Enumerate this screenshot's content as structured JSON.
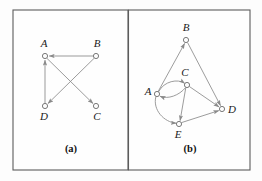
{
  "figure": {
    "background_color": "#fdfdfd",
    "frame_color": "#5c5c5c",
    "edge_color": "#8a8a8a",
    "node_fill": "#fdfdfd",
    "node_stroke": "#6b6b6b",
    "label_color": "#1a1a1a"
  },
  "panels": [
    {
      "id": "panel-a",
      "caption": "(a)",
      "caption_pos": {
        "x": 71,
        "y": 152
      },
      "frame": {
        "x": 13,
        "y": 10,
        "w": 115,
        "h": 160
      },
      "nodes": [
        {
          "id": "A",
          "label": "A",
          "cx": 45,
          "cy": 56,
          "r": 2.6,
          "label_x": 44,
          "label_y": 47
        },
        {
          "id": "B",
          "label": "B",
          "cx": 96,
          "cy": 56,
          "r": 2.6,
          "label_x": 97,
          "label_y": 47
        },
        {
          "id": "D",
          "label": "D",
          "cx": 45,
          "cy": 106,
          "r": 2.6,
          "label_x": 44,
          "label_y": 120
        },
        {
          "id": "C",
          "label": "C",
          "cx": 96,
          "cy": 106,
          "r": 2.6,
          "label_x": 97,
          "label_y": 120
        }
      ],
      "edges": [
        {
          "from": "B",
          "to": "A",
          "type": "straight",
          "directed": true
        },
        {
          "from": "D",
          "to": "A",
          "type": "straight",
          "directed": true
        },
        {
          "from": "B",
          "to": "D",
          "type": "straight",
          "directed": true
        },
        {
          "from": "A",
          "to": "C",
          "type": "straight",
          "directed": true
        }
      ]
    },
    {
      "id": "panel-b",
      "caption": "(b)",
      "caption_pos": {
        "x": 190,
        "y": 152
      },
      "frame": {
        "x": 129,
        "y": 10,
        "w": 121,
        "h": 160
      },
      "nodes": [
        {
          "id": "B",
          "label": "B",
          "cx": 186,
          "cy": 40,
          "r": 2.6,
          "label_x": 186,
          "label_y": 31
        },
        {
          "id": "C",
          "label": "C",
          "cx": 187,
          "cy": 85,
          "r": 2.6,
          "label_x": 185,
          "label_y": 76
        },
        {
          "id": "A",
          "label": "A",
          "cx": 157,
          "cy": 94,
          "r": 2.6,
          "label_x": 148,
          "label_y": 95
        },
        {
          "id": "D",
          "label": "D",
          "cx": 222,
          "cy": 109,
          "r": 2.6,
          "label_x": 232,
          "label_y": 113
        },
        {
          "id": "E",
          "label": "E",
          "cx": 179,
          "cy": 124,
          "r": 2.6,
          "label_x": 178,
          "label_y": 138
        }
      ],
      "edges": [
        {
          "from": "A",
          "to": "B",
          "type": "straight",
          "directed": true
        },
        {
          "from": "B",
          "to": "D",
          "type": "straight",
          "directed": true
        },
        {
          "from": "A",
          "to": "C",
          "type": "curve-up",
          "directed": true
        },
        {
          "from": "C",
          "to": "A",
          "type": "curve-down",
          "directed": true
        },
        {
          "from": "C",
          "to": "D",
          "type": "straight",
          "directed": true
        },
        {
          "from": "C",
          "to": "E",
          "type": "straight",
          "directed": true
        },
        {
          "from": "A",
          "to": "E",
          "type": "curve-left",
          "directed": true
        },
        {
          "from": "E",
          "to": "D",
          "type": "straight",
          "directed": true
        }
      ]
    }
  ],
  "graph_data": {
    "panel_a": {
      "vertices": [
        "A",
        "B",
        "C",
        "D"
      ],
      "directed_edges": [
        [
          "B",
          "A"
        ],
        [
          "D",
          "A"
        ],
        [
          "B",
          "D"
        ],
        [
          "A",
          "C"
        ]
      ]
    },
    "panel_b": {
      "vertices": [
        "A",
        "B",
        "C",
        "D",
        "E"
      ],
      "directed_edges": [
        [
          "A",
          "B"
        ],
        [
          "B",
          "D"
        ],
        [
          "A",
          "C"
        ],
        [
          "C",
          "A"
        ],
        [
          "C",
          "D"
        ],
        [
          "C",
          "E"
        ],
        [
          "A",
          "E"
        ],
        [
          "E",
          "D"
        ]
      ]
    }
  }
}
